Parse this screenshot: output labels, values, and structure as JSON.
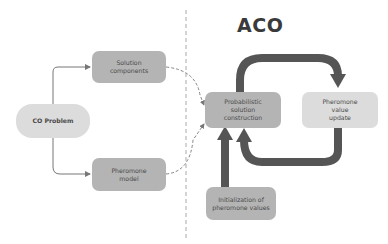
{
  "title": "ACO",
  "nodes": {
    "co_problem": "CO Problem",
    "solution_components": "Solution\ncomponents",
    "pheromone_model": "Pheromone\nmodel",
    "probabilistic_construction": "Probabilistic\nsolution\nconstruction",
    "pheromone_update": "Pheromone\nvalue\nupdate",
    "initialization": "Initialization of\npheromone values"
  },
  "colors": {
    "dark_box": "#b4b4b4",
    "light_box": "#dcdcdc",
    "arrow": "#555555",
    "thin_arrow": "#777777",
    "divider": "#aaaaaa"
  }
}
